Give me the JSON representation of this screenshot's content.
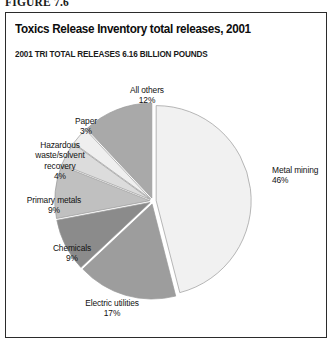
{
  "figure": {
    "label": "FIGURE 7.6"
  },
  "header": {
    "title": "Toxics Release Inventory total releases, 2001",
    "subtitle": "2001 TRI TOTAL RELEASES 6.16 BILLION POUNDS"
  },
  "labels": {
    "metal_mining": "Metal mining\n46%",
    "all_others": "All others\n12%",
    "paper": "Paper\n3%",
    "hazardous": "Hazardous\nwaste/solvent\nrecovery\n4%",
    "primary_metals": "Primary metals\n9%",
    "chemicals": "Chemicals\n9%",
    "electric": "Electric utilities\n17%"
  },
  "chart_data": {
    "type": "pie",
    "title": "Toxics Release Inventory total releases, 2001",
    "subtitle": "2001 TRI TOTAL RELEASES 6.16 BILLION POUNDS",
    "total": "6.16 billion pounds",
    "unit": "percent of total releases",
    "exploded": true,
    "legend": "none (direct slice labels)",
    "grid": false,
    "categories": [
      "Metal mining",
      "Electric utilities",
      "Chemicals",
      "Primary metals",
      "Hazardous waste/solvent recovery",
      "Paper",
      "All others"
    ],
    "values": [
      46,
      17,
      9,
      9,
      4,
      3,
      12
    ],
    "value_labels": [
      "46%",
      "17%",
      "9%",
      "9%",
      "4%",
      "3%",
      "12%"
    ],
    "colors": [
      "#f1f1f1",
      "#9d9d9d",
      "#8b8b8b",
      "#c0c0c0",
      "#dcdcdc",
      "#efefef",
      "#a9a9a9"
    ],
    "slices": [
      {
        "name": "Metal mining",
        "value": 46,
        "label": "46%",
        "color": "#f1f1f1"
      },
      {
        "name": "Electric utilities",
        "value": 17,
        "label": "17%",
        "color": "#9d9d9d"
      },
      {
        "name": "Chemicals",
        "value": 9,
        "label": "9%",
        "color": "#8b8b8b"
      },
      {
        "name": "Primary metals",
        "value": 9,
        "label": "9%",
        "color": "#c0c0c0"
      },
      {
        "name": "Hazardous waste/solvent recovery",
        "value": 4,
        "label": "4%",
        "color": "#dcdcdc"
      },
      {
        "name": "Paper",
        "value": 3,
        "label": "3%",
        "color": "#efefef"
      },
      {
        "name": "All others",
        "value": 12,
        "label": "12%",
        "color": "#a9a9a9"
      }
    ]
  }
}
